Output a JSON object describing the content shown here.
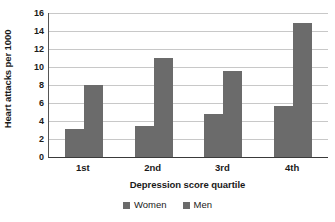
{
  "chart_data": {
    "type": "bar",
    "title": "",
    "xlabel": "Depression score quartile",
    "ylabel": "Heart attacks per 1000",
    "categories": [
      "1st",
      "2nd",
      "3rd",
      "4th"
    ],
    "series": [
      {
        "name": "Women",
        "values": [
          3.1,
          3.5,
          4.8,
          5.7
        ]
      },
      {
        "name": "Men",
        "values": [
          8.0,
          11.0,
          9.6,
          14.9
        ]
      }
    ],
    "ylim": [
      0,
      16
    ],
    "ytick_labels": [
      "16",
      "14",
      "12",
      "10",
      "8",
      "6",
      "4",
      "2",
      "0"
    ],
    "ytick_values": [
      16,
      14,
      12,
      10,
      8,
      6,
      4,
      2,
      0
    ],
    "grid": true,
    "legend_position": "bottom",
    "bar_color": "#6b6b6b",
    "grid_color": "#c8c8c8",
    "axis_color": "#3a3a3a"
  }
}
